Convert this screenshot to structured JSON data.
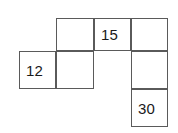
{
  "figure": {
    "kind": "number-grid-puzzle",
    "background_color": "#ffffff",
    "line_color": "#5a5a5a",
    "text_color": "#1a1a1a"
  },
  "grid": {
    "column_edges_px": [
      19,
      56,
      94,
      131,
      168
    ],
    "row_edges_px": [
      18,
      51,
      89,
      127
    ],
    "cells": [
      {
        "id": "cell-r1c2",
        "row": 1,
        "col": 2,
        "value": "",
        "filled": false,
        "align": "align-center",
        "x": 56,
        "y": 18,
        "w": 38,
        "h": 33
      },
      {
        "id": "cell-r1c3",
        "row": 1,
        "col": 3,
        "value": "15",
        "filled": true,
        "align": "align-left",
        "x": 94,
        "y": 18,
        "w": 37,
        "h": 33
      },
      {
        "id": "cell-r1c4",
        "row": 1,
        "col": 4,
        "value": "",
        "filled": false,
        "align": "align-center",
        "x": 131,
        "y": 18,
        "w": 37,
        "h": 33
      },
      {
        "id": "cell-r2c1",
        "row": 2,
        "col": 1,
        "value": "12",
        "filled": true,
        "align": "align-left",
        "x": 19,
        "y": 51,
        "w": 37,
        "h": 38
      },
      {
        "id": "cell-r2c2",
        "row": 2,
        "col": 2,
        "value": "",
        "filled": false,
        "align": "align-center",
        "x": 56,
        "y": 51,
        "w": 38,
        "h": 38
      },
      {
        "id": "cell-r2c4",
        "row": 2,
        "col": 4,
        "value": "",
        "filled": false,
        "align": "align-center",
        "x": 131,
        "y": 51,
        "w": 37,
        "h": 38
      },
      {
        "id": "cell-r3c4",
        "row": 3,
        "col": 4,
        "value": "30",
        "filled": true,
        "align": "align-left",
        "x": 131,
        "y": 89,
        "w": 37,
        "h": 38
      }
    ]
  }
}
